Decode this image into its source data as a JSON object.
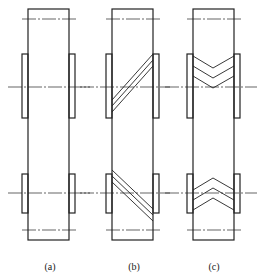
{
  "figure": {
    "line_color": "#222222",
    "background": "#ffffff"
  },
  "panels": [
    {
      "id": "a",
      "label": "(a)",
      "tooth_type": "none"
    },
    {
      "id": "b",
      "label": "(b)",
      "tooth_type": "helical"
    },
    {
      "id": "c",
      "label": "(c)",
      "tooth_type": "herringbone"
    }
  ]
}
